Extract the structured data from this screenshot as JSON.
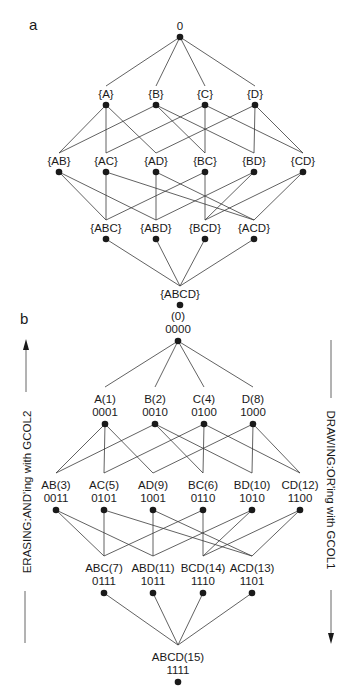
{
  "panel_a": {
    "letter": "a",
    "nodes": [
      {
        "id": "0",
        "label": "0",
        "x": 180,
        "y": 37
      },
      {
        "id": "A",
        "label": "{A}",
        "x": 106,
        "y": 105
      },
      {
        "id": "B",
        "label": "{B}",
        "x": 156,
        "y": 105
      },
      {
        "id": "C",
        "label": "{C}",
        "x": 205,
        "y": 105
      },
      {
        "id": "D",
        "label": "{D}",
        "x": 255,
        "y": 105
      },
      {
        "id": "AB",
        "label": "{AB}",
        "x": 59,
        "y": 172
      },
      {
        "id": "AC",
        "label": "{AC}",
        "x": 106,
        "y": 172
      },
      {
        "id": "AD",
        "label": "{AD}",
        "x": 156,
        "y": 172
      },
      {
        "id": "BC",
        "label": "{BC}",
        "x": 205,
        "y": 172
      },
      {
        "id": "BD",
        "label": "{BD}",
        "x": 254,
        "y": 172
      },
      {
        "id": "CD",
        "label": "{CD}",
        "x": 303,
        "y": 172
      },
      {
        "id": "ABC",
        "label": "{ABC}",
        "x": 106,
        "y": 239
      },
      {
        "id": "ABD",
        "label": "{ABD}",
        "x": 156,
        "y": 239
      },
      {
        "id": "BCD",
        "label": "{BCD}",
        "x": 205,
        "y": 239
      },
      {
        "id": "ACD",
        "label": "{ACD}",
        "x": 254,
        "y": 239
      },
      {
        "id": "ABCD",
        "label": "{ABCD}",
        "x": 180,
        "y": 305
      }
    ],
    "edges": [
      [
        "0",
        "A"
      ],
      [
        "0",
        "B"
      ],
      [
        "0",
        "C"
      ],
      [
        "0",
        "D"
      ],
      [
        "A",
        "AB"
      ],
      [
        "A",
        "AC"
      ],
      [
        "A",
        "AD"
      ],
      [
        "B",
        "AB"
      ],
      [
        "B",
        "BC"
      ],
      [
        "B",
        "BD"
      ],
      [
        "C",
        "AC"
      ],
      [
        "C",
        "BC"
      ],
      [
        "C",
        "CD"
      ],
      [
        "D",
        "AD"
      ],
      [
        "D",
        "BD"
      ],
      [
        "D",
        "CD"
      ],
      [
        "AB",
        "ABC"
      ],
      [
        "AB",
        "ABD"
      ],
      [
        "AC",
        "ABC"
      ],
      [
        "AC",
        "ACD"
      ],
      [
        "AD",
        "ABD"
      ],
      [
        "AD",
        "ACD"
      ],
      [
        "BC",
        "ABC"
      ],
      [
        "BC",
        "BCD"
      ],
      [
        "BD",
        "ABD"
      ],
      [
        "BD",
        "BCD"
      ],
      [
        "CD",
        "BCD"
      ],
      [
        "CD",
        "ACD"
      ],
      [
        "ABC",
        "ABCD"
      ],
      [
        "ABD",
        "ABCD"
      ],
      [
        "BCD",
        "ABCD"
      ],
      [
        "ACD",
        "ABCD"
      ]
    ]
  },
  "panel_b": {
    "letter": "b",
    "nodes": [
      {
        "id": "0",
        "name": "(0)",
        "code": "0000",
        "x": 178,
        "y": 341
      },
      {
        "id": "A",
        "name": "A(1)",
        "code": "0001",
        "x": 105,
        "y": 424
      },
      {
        "id": "B",
        "name": "B(2)",
        "code": "0010",
        "x": 155,
        "y": 424
      },
      {
        "id": "C",
        "name": "C(4)",
        "code": "0100",
        "x": 204,
        "y": 424
      },
      {
        "id": "D",
        "name": "D(8)",
        "code": "1000",
        "x": 253,
        "y": 424
      },
      {
        "id": "AB",
        "name": "AB(3)",
        "code": "0011",
        "x": 56,
        "y": 510
      },
      {
        "id": "AC",
        "name": "AC(5)",
        "code": "0101",
        "x": 104,
        "y": 510
      },
      {
        "id": "AD",
        "name": "AD(9)",
        "code": "1001",
        "x": 153,
        "y": 510
      },
      {
        "id": "BC",
        "name": "BC(6)",
        "code": "0110",
        "x": 203,
        "y": 510
      },
      {
        "id": "BD",
        "name": "BD(10)",
        "code": "1010",
        "x": 252,
        "y": 510
      },
      {
        "id": "CD",
        "name": "CD(12)",
        "code": "1100",
        "x": 300,
        "y": 510
      },
      {
        "id": "ABC",
        "name": "ABC(7)",
        "code": "0111",
        "x": 104,
        "y": 593
      },
      {
        "id": "ABD",
        "name": "ABD(11)",
        "code": "1011",
        "x": 153,
        "y": 593
      },
      {
        "id": "BCD",
        "name": "BCD(14)",
        "code": "1110",
        "x": 203,
        "y": 593
      },
      {
        "id": "ACD",
        "name": "ACD(13)",
        "code": "1101",
        "x": 252,
        "y": 593
      },
      {
        "id": "ABCD",
        "name": "ABCD(15)",
        "code": "1111",
        "x": 178,
        "y": 682
      }
    ],
    "edges": [
      [
        "0",
        "A"
      ],
      [
        "0",
        "B"
      ],
      [
        "0",
        "C"
      ],
      [
        "0",
        "D"
      ],
      [
        "A",
        "AB"
      ],
      [
        "A",
        "AC"
      ],
      [
        "A",
        "AD"
      ],
      [
        "B",
        "AB"
      ],
      [
        "B",
        "BC"
      ],
      [
        "B",
        "BD"
      ],
      [
        "C",
        "AC"
      ],
      [
        "C",
        "BC"
      ],
      [
        "C",
        "CD"
      ],
      [
        "D",
        "AD"
      ],
      [
        "D",
        "BD"
      ],
      [
        "D",
        "CD"
      ],
      [
        "AB",
        "ABC"
      ],
      [
        "AB",
        "ABD"
      ],
      [
        "AC",
        "ABC"
      ],
      [
        "AC",
        "ACD"
      ],
      [
        "AD",
        "ABD"
      ],
      [
        "AD",
        "ACD"
      ],
      [
        "BC",
        "ABC"
      ],
      [
        "BC",
        "BCD"
      ],
      [
        "BD",
        "ABD"
      ],
      [
        "BD",
        "BCD"
      ],
      [
        "CD",
        "BCD"
      ],
      [
        "CD",
        "ACD"
      ],
      [
        "ABC",
        "ABCD"
      ],
      [
        "ABD",
        "ABCD"
      ],
      [
        "BCD",
        "ABCD"
      ],
      [
        "ACD",
        "ABCD"
      ]
    ],
    "left_annotation": "ERASING:AND'ing with GCOL2",
    "right_annotation": "DRAWING:OR'ing with GCOL1"
  },
  "colors": {
    "ink": "#1a1a1a",
    "line": "#3a3a3a",
    "background": "#ffffff"
  }
}
